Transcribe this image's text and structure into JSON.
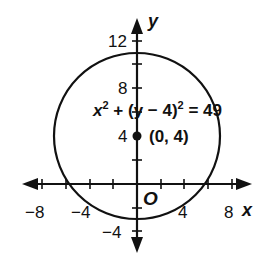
{
  "graph": {
    "x_axis_label": "x",
    "y_axis_label": "y",
    "origin_label": "O",
    "x_ticks": [
      "−8",
      "−4",
      "4",
      "8"
    ],
    "y_ticks": [
      "12",
      "8",
      "4",
      "−4"
    ],
    "equation": {
      "x": "x",
      "sup1": "2",
      "plus": " + ",
      "paren": "(y − 4)",
      "sup2": "2",
      "rhs": " = 49"
    },
    "center_point_label": "(0, 4)",
    "circle": {
      "center": [
        0,
        4
      ],
      "radius": 7
    },
    "colors": {
      "stroke": "#111111",
      "background": "#ffffff"
    }
  }
}
